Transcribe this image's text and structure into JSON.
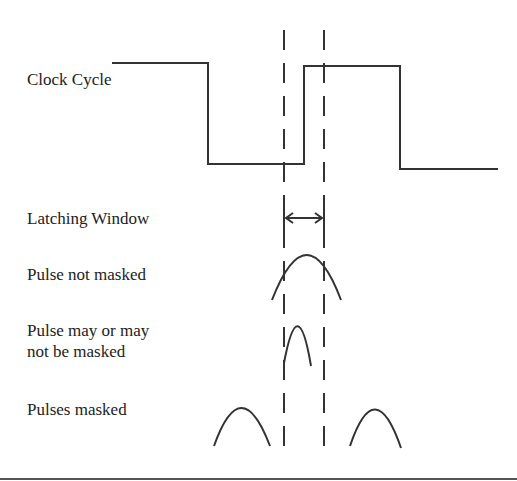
{
  "diagram": {
    "labels": {
      "clock_cycle": "Clock Cycle",
      "latching_window": "Latching Window",
      "pulse_not_masked": "Pulse not masked",
      "pulse_may_line1": "Pulse may or may",
      "pulse_may_line2": "not be masked",
      "pulses_masked": "Pulses masked"
    },
    "colors": {
      "stroke": "#333333",
      "background": "#ffffff"
    },
    "clock_waveform": {
      "levels": [
        "high",
        "low",
        "high",
        "low"
      ]
    },
    "latching_window": {
      "marker": "double-headed-arrow"
    }
  }
}
